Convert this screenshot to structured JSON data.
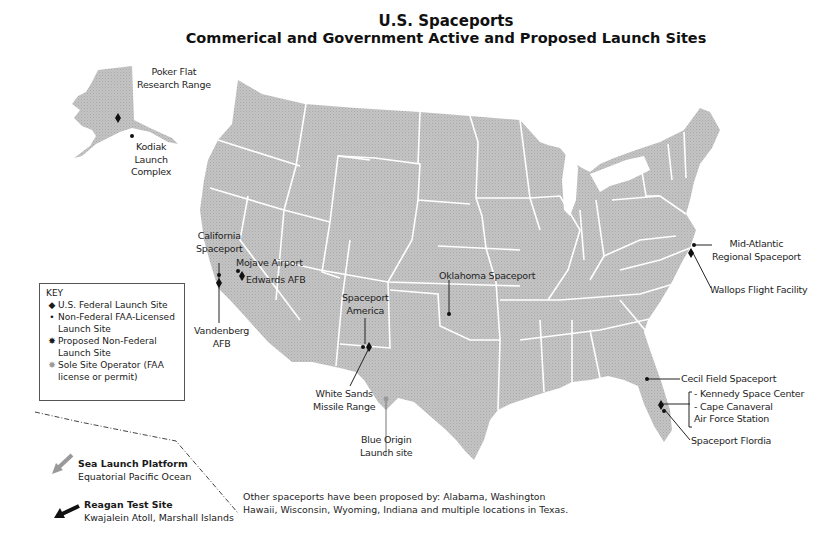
{
  "title": {
    "line1": "U.S. Spaceports",
    "line2": "Commerical and Government Active and Proposed Launch Sites"
  },
  "colors": {
    "land": "#bdbdbd",
    "state_border": "#ffffff",
    "marker": "#111111",
    "sole_operator_marker": "#999999",
    "background": "#ffffff"
  },
  "key": {
    "heading": "KEY",
    "items": [
      {
        "symbol": "diamond",
        "glyph": "◆",
        "label": "U.S. Federal Launch Site"
      },
      {
        "symbol": "dot",
        "glyph": "•",
        "label": "Non-Federal FAA-Licensed Launch Site"
      },
      {
        "symbol": "starburst",
        "glyph": "✸",
        "label": "Proposed Non-Federal Launch Site"
      },
      {
        "symbol": "gray-starburst",
        "glyph": "✸",
        "label": "Sole Site Operator (FAA license or permit)"
      }
    ]
  },
  "sites": {
    "poker_flat": {
      "line1": "Poker Flat",
      "line2": "Research Range",
      "type": "federal"
    },
    "kodiak": {
      "line1": "Kodiak",
      "line2": "Launch",
      "line3": "Complex",
      "type": "non-federal"
    },
    "california": {
      "line1": "California",
      "line2": "Spaceport",
      "type": "non-federal"
    },
    "vandenberg": {
      "line1": "Vandenberg",
      "line2": "AFB",
      "type": "federal"
    },
    "mojave": {
      "label": "Mojave Airport",
      "type": "non-federal"
    },
    "edwards": {
      "label": "Edwards AFB",
      "type": "federal"
    },
    "spaceport_america": {
      "line1": "Spaceport",
      "line2": "America",
      "type": "non-federal"
    },
    "white_sands": {
      "line1": "White Sands",
      "line2": "Missile Range",
      "type": "federal"
    },
    "blue_origin": {
      "line1": "Blue Origin",
      "line2": "Launch site",
      "type": "sole-operator"
    },
    "oklahoma": {
      "label": "Oklahoma Spaceport",
      "type": "non-federal"
    },
    "mid_atlantic": {
      "line1": "Mid-Atlantic",
      "line2": "Regional Spaceport",
      "type": "non-federal"
    },
    "wallops": {
      "label": "Wallops Flight Facility",
      "type": "federal"
    },
    "cecil_field": {
      "label": "Cecil Field Spaceport",
      "type": "non-federal"
    },
    "kennedy_group": {
      "line1": "- Kennedy Space Center",
      "line2": "- Cape Canaveral",
      "line3": "Air Force Station",
      "type": "federal"
    },
    "spaceport_florida": {
      "label": "Spaceport Flordia",
      "type": "non-federal"
    }
  },
  "offshore": {
    "sea_launch": {
      "title": "Sea Launch Platform",
      "subtitle": "Equatorial Pacific Ocean"
    },
    "reagan": {
      "title": "Reagan Test Site",
      "subtitle": "Kwajalein Atoll, Marshall Islands"
    }
  },
  "note": {
    "line1": "Other spaceports have been proposed by: Alabama, Washington",
    "line2": "Hawaii, Wisconsin, Wyoming, Indiana and multiple locations in Texas."
  }
}
